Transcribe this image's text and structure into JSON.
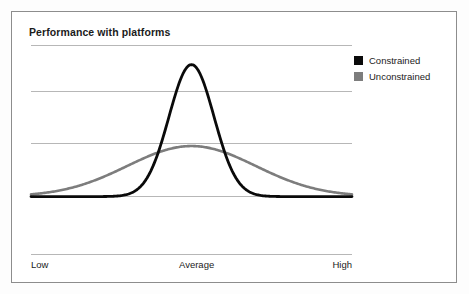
{
  "chart": {
    "title": "Performance with platforms"
  },
  "legend": {
    "position": "right",
    "items": [
      {
        "label": "Constrained",
        "color": "#0a0a0a",
        "swatch": "legend-swatch-constrained"
      },
      {
        "label": "Unconstrained",
        "color": "#7d7d7d",
        "swatch": "legend-swatch-unconstrained"
      }
    ]
  },
  "axis": {
    "ticks": [
      {
        "label": "Low"
      },
      {
        "label": "Average"
      },
      {
        "label": "High"
      }
    ]
  },
  "chart_data": {
    "type": "line",
    "title": "Performance with platforms",
    "xlabel": "",
    "ylabel": "",
    "xlim": [
      0,
      100
    ],
    "ylim": [
      0,
      1
    ],
    "grid": true,
    "gridlines_y": [
      1.0,
      0.72,
      0.4,
      0.07
    ],
    "xtick_positions": [
      0,
      50,
      100
    ],
    "xtick_labels": [
      "Low",
      "Average",
      "High"
    ],
    "legend_position": "right",
    "series": [
      {
        "name": "Constrained",
        "color": "#0a0a0a",
        "distribution": "gaussian",
        "mean": 50,
        "std": 7.0,
        "peak": 0.88,
        "baseline": 0.07,
        "x": [
          0,
          5,
          10,
          15,
          20,
          25,
          30,
          32,
          34,
          36,
          38,
          40,
          42,
          44,
          46,
          48,
          50,
          52,
          54,
          56,
          58,
          60,
          62,
          64,
          66,
          68,
          70,
          75,
          80,
          85,
          90,
          95,
          100
        ],
        "y": [
          0.07,
          0.07,
          0.07,
          0.07,
          0.07,
          0.07,
          0.08,
          0.09,
          0.11,
          0.15,
          0.21,
          0.3,
          0.42,
          0.56,
          0.7,
          0.82,
          0.88,
          0.82,
          0.7,
          0.56,
          0.42,
          0.3,
          0.21,
          0.15,
          0.11,
          0.09,
          0.08,
          0.07,
          0.07,
          0.07,
          0.07,
          0.07,
          0.07
        ]
      },
      {
        "name": "Unconstrained",
        "color": "#7d7d7d",
        "distribution": "gaussian",
        "mean": 50,
        "std": 20.0,
        "peak": 0.38,
        "baseline": 0.07,
        "x": [
          0,
          5,
          10,
          15,
          20,
          25,
          30,
          35,
          40,
          45,
          50,
          55,
          60,
          65,
          70,
          75,
          80,
          85,
          90,
          95,
          100
        ],
        "y": [
          0.07,
          0.08,
          0.1,
          0.13,
          0.17,
          0.22,
          0.27,
          0.32,
          0.36,
          0.38,
          0.38,
          0.38,
          0.36,
          0.32,
          0.27,
          0.22,
          0.17,
          0.13,
          0.1,
          0.08,
          0.07
        ]
      }
    ]
  }
}
